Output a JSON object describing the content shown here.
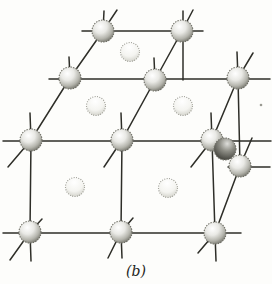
{
  "figure": {
    "label": "(b)",
    "canvas": {
      "width": 272,
      "height": 284,
      "background": "#fdfdfb"
    },
    "style": {
      "bond_color": "#2e2e28",
      "bond_width": 1.5,
      "corner_atom_edge": "#6f6f66",
      "face_atom_edge": "#8a8a80",
      "label_color": "#1c1c1a",
      "label_font_size": 14,
      "label_x": 136,
      "label_y": 276
    },
    "atom_types": {
      "corner": {
        "r": 11,
        "icon": "shaded-sphere-icon"
      },
      "shaded": {
        "r": 11,
        "icon": "dark-sphere-icon"
      },
      "face": {
        "r": 9.5,
        "icon": "stippled-sphere-icon"
      }
    },
    "atoms": [
      {
        "id": "top-back-left",
        "x": 103,
        "y": 31,
        "type": "corner"
      },
      {
        "id": "top-back-right",
        "x": 182,
        "y": 31,
        "type": "corner"
      },
      {
        "id": "top-mid-left",
        "x": 70,
        "y": 78,
        "type": "corner"
      },
      {
        "id": "top-mid-center",
        "x": 155,
        "y": 80,
        "type": "corner"
      },
      {
        "id": "top-mid-right",
        "x": 238,
        "y": 78,
        "type": "corner"
      },
      {
        "id": "top-front-left",
        "x": 31,
        "y": 140,
        "type": "corner"
      },
      {
        "id": "top-front-center",
        "x": 122,
        "y": 140,
        "type": "corner"
      },
      {
        "id": "top-front-right",
        "x": 212,
        "y": 140,
        "type": "corner"
      },
      {
        "id": "right-face-center",
        "x": 225,
        "y": 149,
        "type": "shaded"
      },
      {
        "id": "bottom-mid-right",
        "x": 240,
        "y": 166,
        "type": "corner"
      },
      {
        "id": "bottom-front-left",
        "x": 30,
        "y": 232,
        "type": "corner"
      },
      {
        "id": "bottom-front-center",
        "x": 121,
        "y": 232,
        "type": "corner"
      },
      {
        "id": "bottom-front-right",
        "x": 215,
        "y": 233,
        "type": "corner"
      },
      {
        "id": "top-face-back-center",
        "x": 130,
        "y": 52,
        "type": "face"
      },
      {
        "id": "top-face-front-left-center",
        "x": 96,
        "y": 106,
        "type": "face"
      },
      {
        "id": "top-face-front-right-center",
        "x": 183,
        "y": 106,
        "type": "face"
      },
      {
        "id": "front-face-left-center",
        "x": 75,
        "y": 187,
        "type": "face"
      },
      {
        "id": "front-face-right-center",
        "x": 168,
        "y": 188,
        "type": "face"
      }
    ],
    "bonds": [
      {
        "name": "edge-back-top",
        "pts": [
          [
            82,
            31
          ],
          [
            203,
            31
          ]
        ]
      },
      {
        "name": "edge-middle-row",
        "pts": [
          [
            49,
            79
          ],
          [
            270,
            79
          ]
        ]
      },
      {
        "name": "edge-front-top",
        "pts": [
          [
            3,
            141
          ],
          [
            271,
            141
          ]
        ]
      },
      {
        "name": "edge-right-back-bottom",
        "pts": [
          [
            228,
            167
          ],
          [
            270,
            167
          ]
        ]
      },
      {
        "name": "edge-front-bottom",
        "pts": [
          [
            3,
            233
          ],
          [
            241,
            233
          ]
        ]
      },
      {
        "name": "axis-vertical-back-left",
        "pts": [
          [
            104,
            11
          ],
          [
            103,
            31
          ]
        ]
      },
      {
        "name": "axis-vertical-back-right",
        "pts": [
          [
            183,
            11
          ],
          [
            183,
            80
          ]
        ]
      },
      {
        "name": "axis-vertical-mid-left",
        "pts": [
          [
            69,
            57
          ],
          [
            70,
            78
          ]
        ]
      },
      {
        "name": "axis-vertical-mid-center",
        "pts": [
          [
            154,
            58
          ],
          [
            155,
            80
          ]
        ]
      },
      {
        "name": "axis-vertical-mid-right",
        "pts": [
          [
            237,
            52
          ],
          [
            238,
            78
          ],
          [
            240,
            166
          ]
        ]
      },
      {
        "name": "axis-vertical-front-left",
        "pts": [
          [
            30,
            113
          ],
          [
            31,
            140
          ],
          [
            30,
            232
          ],
          [
            31,
            261
          ]
        ]
      },
      {
        "name": "axis-vertical-front-center",
        "pts": [
          [
            121,
            113
          ],
          [
            122,
            140
          ],
          [
            121,
            232
          ],
          [
            122,
            258
          ]
        ]
      },
      {
        "name": "axis-vertical-front-right",
        "pts": [
          [
            211,
            113
          ],
          [
            212,
            140
          ],
          [
            215,
            233
          ],
          [
            216,
            261
          ]
        ]
      },
      {
        "name": "axis-depth-left",
        "pts": [
          [
            8,
            167
          ],
          [
            31,
            140
          ],
          [
            70,
            78
          ],
          [
            103,
            31
          ],
          [
            117,
            10
          ]
        ]
      },
      {
        "name": "axis-depth-center",
        "pts": [
          [
            104,
            167
          ],
          [
            122,
            140
          ],
          [
            155,
            80
          ],
          [
            182,
            31
          ],
          [
            193,
            10
          ]
        ]
      },
      {
        "name": "axis-depth-right",
        "pts": [
          [
            191,
            167
          ],
          [
            212,
            140
          ],
          [
            238,
            78
          ],
          [
            253,
            53
          ]
        ]
      },
      {
        "name": "axis-depth-bottom-left",
        "pts": [
          [
            10,
            260
          ],
          [
            30,
            232
          ],
          [
            42,
            219
          ]
        ]
      },
      {
        "name": "axis-depth-bottom-center",
        "pts": [
          [
            108,
            258
          ],
          [
            121,
            232
          ],
          [
            133,
            218
          ]
        ]
      },
      {
        "name": "axis-depth-bottom-right",
        "pts": [
          [
            198,
            253
          ],
          [
            215,
            233
          ],
          [
            240,
            166
          ],
          [
            252,
            138
          ]
        ]
      }
    ],
    "artifact": {
      "x": 261,
      "y": 105,
      "note": "small print speck"
    }
  }
}
